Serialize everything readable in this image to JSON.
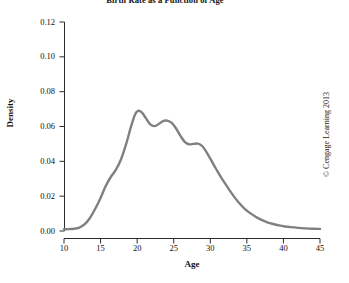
{
  "chart_data": {
    "type": "line",
    "title": "Birth Rate as a Function of Age",
    "xlabel": "Age",
    "ylabel": "Density",
    "xlim": [
      10,
      45
    ],
    "ylim": [
      0.0,
      0.12
    ],
    "grid": false,
    "legend": null,
    "line_color": "#808080",
    "line_width": 2.4,
    "xticks": [
      10,
      15,
      20,
      25,
      30,
      35,
      40,
      45
    ],
    "xtick_labels": [
      "10",
      "15",
      "20",
      "25",
      "30",
      "35",
      "40",
      "45"
    ],
    "yticks": [
      0.0,
      0.02,
      0.04,
      0.06,
      0.08,
      0.1,
      0.12
    ],
    "ytick_labels": [
      "0.00",
      "0.02",
      "0.04",
      "0.06",
      "0.08",
      "0.10",
      "0.12"
    ],
    "series": [
      {
        "name": "Birth rate density",
        "x": [
          10.0,
          10.7,
          11.4,
          12.1,
          12.8,
          13.5,
          14.2,
          15.0,
          15.7,
          16.4,
          17.1,
          17.8,
          18.5,
          19.2,
          19.7,
          20.1,
          20.6,
          21.2,
          21.8,
          22.4,
          23.0,
          23.6,
          24.1,
          24.7,
          25.3,
          25.9,
          26.5,
          27.1,
          27.7,
          28.3,
          28.9,
          29.5,
          30.1,
          30.8,
          31.5,
          32.2,
          33.0,
          33.8,
          34.6,
          35.4,
          36.2,
          37.0,
          37.8,
          38.6,
          39.4,
          40.2,
          41.0,
          42.0,
          43.0,
          44.0,
          45.0
        ],
        "y": [
          0.001,
          0.0011,
          0.0013,
          0.002,
          0.0038,
          0.0072,
          0.0122,
          0.019,
          0.0258,
          0.031,
          0.0352,
          0.0412,
          0.05,
          0.0605,
          0.0668,
          0.069,
          0.0682,
          0.0648,
          0.0612,
          0.0602,
          0.0616,
          0.0632,
          0.0634,
          0.0622,
          0.059,
          0.0548,
          0.0512,
          0.0498,
          0.05,
          0.0502,
          0.0488,
          0.0452,
          0.0408,
          0.0356,
          0.0306,
          0.0262,
          0.0212,
          0.0168,
          0.0132,
          0.0104,
          0.0082,
          0.0064,
          0.005,
          0.004,
          0.0032,
          0.0026,
          0.0022,
          0.0018,
          0.0015,
          0.0013,
          0.0012
        ]
      }
    ],
    "annotations": [
      {
        "name": "primary-mode",
        "x": 20.1,
        "y": 0.069,
        "label": "main peak"
      },
      {
        "name": "secondary-mode",
        "x": 24.1,
        "y": 0.0634,
        "label": "second mode"
      },
      {
        "name": "shoulder-mode",
        "x": 28.3,
        "y": 0.0502,
        "label": "shoulder"
      }
    ]
  },
  "watermark": {
    "text": "© Cengage Learning 2013"
  }
}
